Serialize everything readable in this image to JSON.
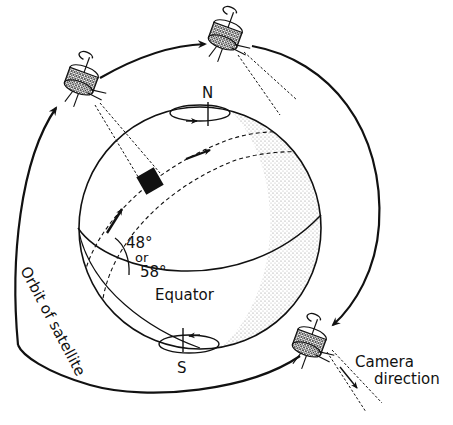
{
  "diagram": {
    "colors": {
      "ink": "#111111",
      "background": "#ffffff",
      "stipple": "#9a9a9a"
    },
    "labels": {
      "north": "N",
      "south": "S",
      "equator": "Equator",
      "angle_line1": "48°",
      "angle_line2": "or",
      "angle_line3": "58°",
      "orbit": "Orbit of satellite",
      "camera_line1": "Camera",
      "camera_line2": "direction"
    },
    "satellites": [
      {
        "name": "satellite-upper-left",
        "position": "upper-left"
      },
      {
        "name": "satellite-top",
        "position": "top"
      },
      {
        "name": "satellite-lower-right",
        "position": "lower-right"
      }
    ],
    "elements": {
      "earth": "globe with shaded night side",
      "imaging_square": "black square on ground track",
      "ground_track": "dashed swath band",
      "rotation_indicators": [
        "north-pole rotation arrow",
        "south-pole rotation arrow"
      ]
    }
  }
}
